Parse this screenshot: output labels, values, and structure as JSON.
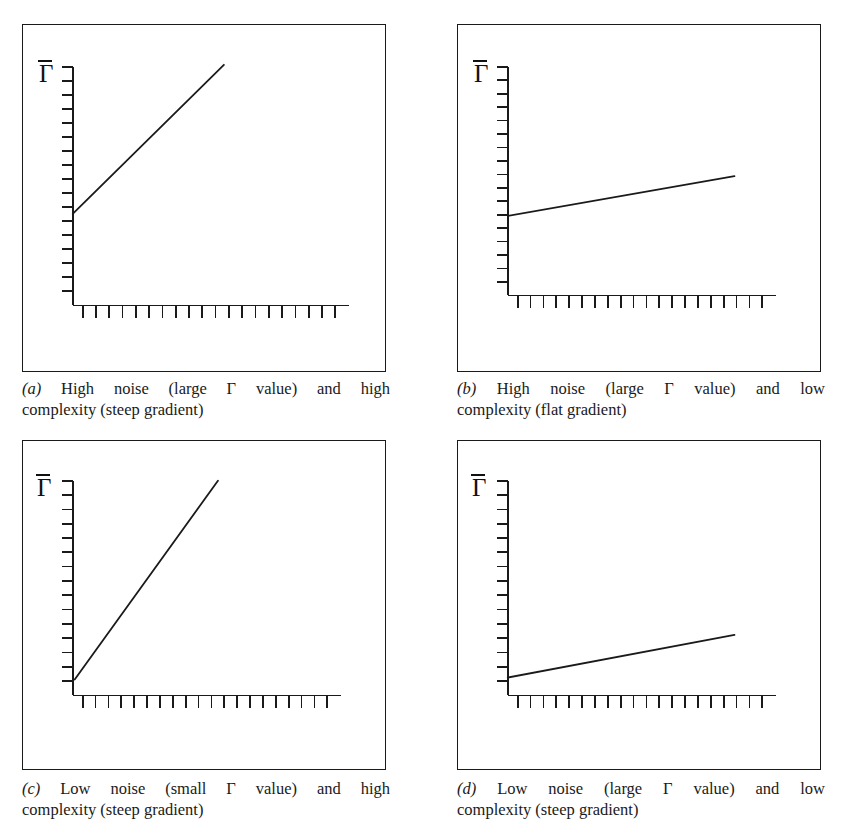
{
  "figure": {
    "background_color": "#ffffff",
    "ink_color": "#1a1a1a",
    "axis_label": "Γ",
    "axis_label_name": "gamma-bar"
  },
  "chart_data": [
    {
      "id": "panel-a",
      "type": "line",
      "title": "",
      "xlabel": "",
      "ylabel": "Γ̄",
      "xlim": [
        0,
        100
      ],
      "ylim": [
        0,
        100
      ],
      "grid": false,
      "legend": "none",
      "x_ticks": 20,
      "y_ticks": 17,
      "x_tick_direction": "outward-down",
      "y_tick_direction": "outward-left",
      "series": [
        {
          "name": "high-noise-steep",
          "x": [
            0,
            45
          ],
          "y": [
            32,
            100
          ],
          "intercept": 32,
          "slope": 1.51
        }
      ],
      "caption_tag": "(a)",
      "caption_line1": "High noise (large Γ value) and high",
      "caption_line2": "complexity (steep gradient)"
    },
    {
      "id": "panel-b",
      "type": "line",
      "title": "",
      "xlabel": "",
      "ylabel": "Γ̄",
      "xlim": [
        0,
        100
      ],
      "ylim": [
        0,
        100
      ],
      "grid": false,
      "legend": "none",
      "x_ticks": 20,
      "y_ticks": 17,
      "x_tick_direction": "outward-down",
      "y_tick_direction": "outward-left",
      "series": [
        {
          "name": "high-noise-flat",
          "x": [
            0,
            82
          ],
          "y": [
            31,
            47
          ],
          "intercept": 31,
          "slope": 0.2
        }
      ],
      "caption_tag": "(b)",
      "caption_line1": "High noise (large Γ value) and low",
      "caption_line2": "complexity (flat gradient)"
    },
    {
      "id": "panel-c",
      "type": "line",
      "title": "",
      "xlabel": "",
      "ylabel": "Γ̄",
      "xlim": [
        0,
        100
      ],
      "ylim": [
        0,
        100
      ],
      "grid": false,
      "legend": "none",
      "x_ticks": 20,
      "y_ticks": 15,
      "x_tick_direction": "outward-down",
      "y_tick_direction": "outward-left",
      "series": [
        {
          "name": "low-noise-steep",
          "x": [
            0,
            52
          ],
          "y": [
            4,
            100
          ],
          "intercept": 4,
          "slope": 1.85
        }
      ],
      "caption_tag": "(c)",
      "caption_line1": "Low noise (small Γ value) and high",
      "caption_line2": "complexity (steep gradient)"
    },
    {
      "id": "panel-d",
      "type": "line",
      "title": "",
      "xlabel": "",
      "ylabel": "Γ̄",
      "xlim": [
        0,
        100
      ],
      "ylim": [
        0,
        100
      ],
      "grid": false,
      "legend": "none",
      "x_ticks": 20,
      "y_ticks": 15,
      "x_tick_direction": "outward-down",
      "y_tick_direction": "outward-left",
      "series": [
        {
          "name": "low-noise-flat",
          "x": [
            0,
            82
          ],
          "y": [
            5,
            25
          ],
          "intercept": 5,
          "slope": 0.24
        }
      ],
      "caption_tag": "(d)",
      "caption_line1": "Low noise (large Γ value) and low",
      "caption_line2": "complexity (steep gradient)"
    }
  ]
}
